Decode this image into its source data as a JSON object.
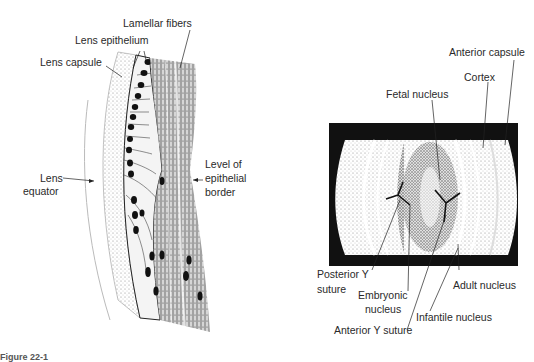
{
  "left_figure": {
    "title": "Lens equatorial region (histology drawing)",
    "labels": {
      "lamellar_fibers": "Lamellar fibers",
      "lens_epithelium": "Lens epithelium",
      "lens_capsule": "Lens capsule",
      "lens_equator_1": "Lens",
      "lens_equator_2": "equator",
      "epithelial_border_1": "Level of",
      "epithelial_border_2": "epithelial",
      "epithelial_border_3": "border"
    }
  },
  "right_figure": {
    "title": "Slit-lamp view of lens zones",
    "labels": {
      "anterior_capsule": "Anterior capsule",
      "cortex": "Cortex",
      "fetal_nucleus": "Fetal nucleus",
      "posterior_y_suture_1": "Posterior Y",
      "posterior_y_suture_2": "suture",
      "embryonic_nucleus_1": "Embryonic",
      "embryonic_nucleus_2": "nucleus",
      "adult_nucleus": "Adult nucleus",
      "infantile_nucleus": "Infantile nucleus",
      "anterior_y_suture": "Anterior Y suture"
    }
  },
  "caption": "Figure 22-1"
}
